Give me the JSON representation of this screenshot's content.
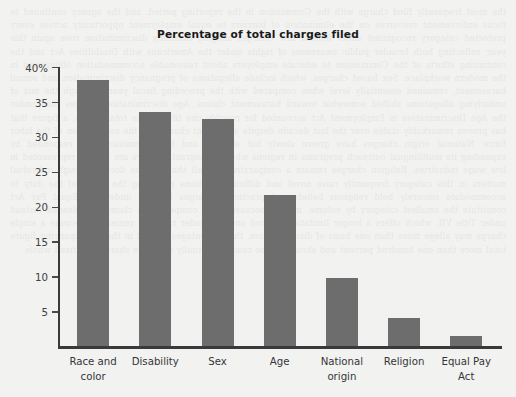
{
  "chart_data": {
    "type": "bar",
    "title": "Percentage of total charges filed",
    "xlabel": "",
    "ylabel": "",
    "ylim": [
      0,
      40
    ],
    "grid": false,
    "legend": "none",
    "categories": [
      "Race and\ncolor",
      "Disability",
      "Sex",
      "Age",
      "National\norigin",
      "Religion",
      "Equal Pay\nAct"
    ],
    "values": [
      38.1,
      33.6,
      32.5,
      21.6,
      9.8,
      4.0,
      1.5
    ],
    "y_ticks": [
      {
        "value": 40,
        "label": "40%"
      },
      {
        "value": 35,
        "label": "35"
      },
      {
        "value": 30,
        "label": "30"
      },
      {
        "value": 25,
        "label": "25"
      },
      {
        "value": 20,
        "label": "20"
      },
      {
        "value": 15,
        "label": "15"
      },
      {
        "value": 10,
        "label": "10"
      },
      {
        "value": 5,
        "label": "5"
      }
    ],
    "bar_color": "#6d6d6d",
    "axis_color": "#3a3a3c",
    "background_color": "#f2f2f0"
  },
  "page_bleed_text": "the most frequently filed charge with the Commission in the reporting period, and the agency continued to focus enforcement resources on the elimination of barriers to equal employment opportunity across every protected category recognized under federal law. Charges alleging disability discrimination rose again this year, reflecting both broader public awareness of rights under the Americans with Disabilities Act and the continuing efforts of the Commission to educate employers about reasonable accommodation obligations in the modern workplace. Sex based charges, which include allegations of pregnancy discrimination and sexual harassment, remained essentially level when compared with the preceding fiscal year, although the mix of underlying allegations shifted somewhat toward harassment claims. Age discrimination charges filed under the Age Discrimination in Employment Act accounted for roughly one fifth of the total intake, a figure that has proven remarkably stable over the last decade despite significant changes in the composition of the labor force. National origin charges have grown slowly but steadily, and the Commission has responded by expanding its multilingual outreach programs in regions where immigrant workers are heavily represented in low wage industries. Religion charges remain a comparatively small share of the docket, though individual matters in this category frequently raise novel and difficult questions regarding the scope of the duty to accommodate sincerely held religious beliefs and practices. Charges brought under the Equal Pay Act constitute the smallest category by volume, in part because many compensation claims are pleaded instead under Title VII, which offers a longer limitations period and a broader range of remedies. Because a single charge may allege more than one basis of discrimination, the percentages set out in the accompanying figure total more than one hundred percent and should not be read as mutually exclusive shares of a fixed whole."
}
